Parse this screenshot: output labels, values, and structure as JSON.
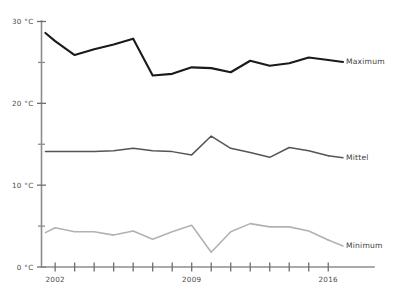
{
  "chart_data": {
    "type": "line",
    "title": "",
    "xlabel": "",
    "ylabel": "",
    "xlim": [
      2001.3,
      2016.5
    ],
    "ylim": [
      0,
      31
    ],
    "grid": false,
    "legend_position": "right-inline",
    "x_tick_labels": [
      "2002",
      "2009",
      "2016"
    ],
    "x_ticks_all": [
      2002,
      2003,
      2004,
      2005,
      2006,
      2007,
      2008,
      2009,
      2010,
      2011,
      2012,
      2013,
      2014,
      2015,
      2016
    ],
    "y_ticks_major": [
      0,
      10,
      20,
      30
    ],
    "y_ticks_minor": [
      5,
      15,
      25
    ],
    "y_tick_labels": [
      "0 °C",
      "10 °C",
      "20 °C",
      "30 °C"
    ],
    "x": [
      2001.5,
      2002,
      2003,
      2004,
      2005,
      2006,
      2007,
      2008,
      2009,
      2010,
      2011,
      2012,
      2013,
      2014,
      2015,
      2016
    ],
    "series": [
      {
        "name": "Maximum",
        "color": "#1a1a1a",
        "width": 2.1,
        "values": [
          28.6,
          27.6,
          25.9,
          26.6,
          27.2,
          27.9,
          23.4,
          23.6,
          24.4,
          24.3,
          23.8,
          25.2,
          24.6,
          24.9,
          25.6,
          25.3
        ]
      },
      {
        "name": "Mittel",
        "color": "#555555",
        "width": 1.5,
        "values": [
          14.1,
          14.1,
          14.1,
          14.1,
          14.2,
          14.5,
          14.2,
          14.1,
          13.7,
          16.0,
          14.5,
          14.0,
          13.4,
          14.6,
          14.2,
          13.6
        ]
      },
      {
        "name": "Minimum",
        "color": "#b2b2b2",
        "width": 1.6,
        "values": [
          4.2,
          4.8,
          4.3,
          4.3,
          3.9,
          4.4,
          3.4,
          4.3,
          5.1,
          1.8,
          4.3,
          5.3,
          4.9,
          4.9,
          4.4,
          3.3
        ]
      }
    ]
  },
  "legend": {
    "items": [
      {
        "label": "Maximum"
      },
      {
        "label": "Mittel"
      },
      {
        "label": "Minimum"
      }
    ]
  }
}
